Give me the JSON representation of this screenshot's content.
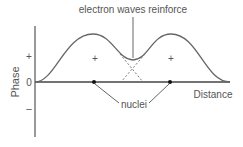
{
  "diagram": {
    "title_label": "electron waves reinforce",
    "y_axis_label": "Phase",
    "x_axis_label": "Distance",
    "nuclei_label": "nuclei",
    "y_ticks": {
      "plus": "+",
      "zero": "0",
      "minus": "–"
    },
    "region_signs": [
      "+",
      "+"
    ],
    "colors": {
      "stroke": "#666666",
      "dot": "#111111",
      "text": "#555555"
    }
  }
}
